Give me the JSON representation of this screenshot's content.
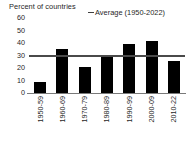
{
  "chart_data": {
    "type": "bar",
    "title": "Percent of countries",
    "xlabel": "",
    "ylabel": "Percent of countries",
    "categories": [
      "1950-59",
      "1960-69",
      "1970-79",
      "1980-89",
      "1990-99",
      "2000-09",
      "2010-22"
    ],
    "values": [
      9,
      35,
      21,
      30,
      39,
      41.5,
      25.5
    ],
    "series": [
      {
        "name": "Percent of countries",
        "type": "bar",
        "values": [
          9,
          35,
          21,
          30,
          39,
          41.5,
          25.5
        ],
        "color": "#000000"
      },
      {
        "name": "Average (1950-2022)",
        "type": "line",
        "value": 29,
        "color": "#4a4a4a"
      }
    ],
    "ylim": [
      0,
      60
    ],
    "yticks": [
      0,
      10,
      20,
      30,
      40,
      50,
      60
    ],
    "ytick_labels": [
      "0",
      "10",
      "20",
      "30",
      "40",
      "50",
      "60"
    ],
    "grid": false,
    "legend": {
      "position": "top-right",
      "entries": [
        {
          "label": "Average (1950-2022)",
          "marker": "line-marker",
          "color": "#4a4a4a"
        }
      ]
    },
    "annotations": []
  },
  "colors": {
    "bar": "#000000",
    "average_line": "#4a4a4a",
    "axis": "#7a7a7a",
    "text": "#1f1f1f",
    "background": "#ffffff"
  }
}
